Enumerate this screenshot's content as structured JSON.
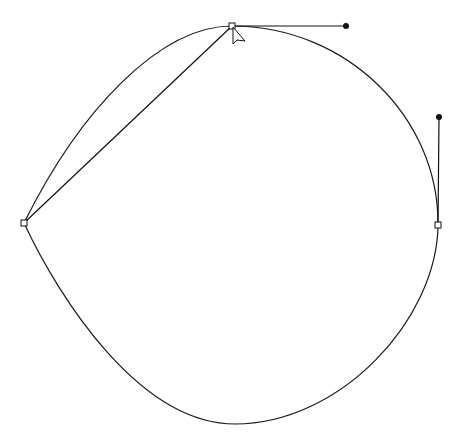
{
  "diagram": {
    "type": "bezier-path-editor",
    "background": "#ffffff",
    "stroke_color": "#1a1a1a",
    "path": {
      "closed": true,
      "segments": [
        {
          "from": "top",
          "to": "right",
          "c1": [
            346,
            26
          ],
          "c2": [
            439,
            117
          ]
        },
        {
          "from": "right",
          "to": "bottom",
          "c1": [
            437,
            320
          ],
          "c2": [
            340,
            424
          ]
        },
        {
          "from": "bottom",
          "to": "left",
          "c1": [
            140,
            424
          ],
          "c2": [
            60,
            300
          ]
        },
        {
          "from": "left",
          "to": "top",
          "c1": [
            80,
            110
          ],
          "c2": [
            160,
            26
          ]
        }
      ]
    },
    "anchors": [
      {
        "name": "top",
        "x": 232,
        "y": 26,
        "selected": true
      },
      {
        "name": "right",
        "x": 438,
        "y": 225,
        "selected": true
      },
      {
        "name": "left",
        "x": 24,
        "y": 223,
        "selected": false
      },
      {
        "name": "bottom",
        "x": 235,
        "y": 424,
        "hidden": true
      }
    ],
    "handles": [
      {
        "anchor": "top",
        "x": 346,
        "y": 26
      },
      {
        "anchor": "right",
        "x": 439,
        "y": 117
      }
    ],
    "guide_line": {
      "from": [
        24,
        223
      ],
      "to": [
        232,
        26
      ]
    },
    "cursor": {
      "type": "arrow-pointer",
      "x": 233,
      "y": 27
    }
  }
}
